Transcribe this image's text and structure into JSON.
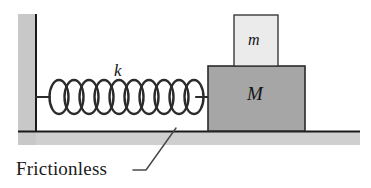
{
  "figure": {
    "kind": "physics-diagram",
    "width": 371,
    "height": 188,
    "background_color": "#ffffff"
  },
  "labels": {
    "spring_constant": "k",
    "top_block": "m",
    "bottom_block": "M",
    "surface": "Frictionless"
  },
  "colors": {
    "wall_fill": "#c8c8c8",
    "floor_fill": "#cfcfcf",
    "block_M_fill": "#a6a6a6",
    "block_m_fill": "#ebebeb",
    "outline": "#1a1a1a",
    "spring_stroke": "#2b2b2b",
    "leader_line": "#4a4a4a",
    "text": "#141414"
  },
  "geometry": {
    "wall": {
      "x": 18,
      "y": 14,
      "width": 18,
      "height": 130
    },
    "floor": {
      "x": 18,
      "y": 131,
      "width": 342,
      "height": 14
    },
    "floor_line_y": 131,
    "floor_line_x1": 18,
    "floor_line_x2": 360,
    "block_M": {
      "x": 208,
      "y": 66,
      "width": 97,
      "height": 65
    },
    "block_m": {
      "x": 234,
      "y": 15,
      "width": 44,
      "height": 51
    },
    "spring": {
      "anchor_left_x": 36,
      "anchor_right_x": 208,
      "center_y": 97,
      "coil_count": 10,
      "coil_radius_x": 9,
      "coil_radius_y": 17,
      "lead_in_length": 14
    },
    "leader_line": {
      "x1": 133,
      "y1": 170,
      "x2": 146,
      "y2": 170,
      "x3": 176,
      "y3": 128
    }
  }
}
